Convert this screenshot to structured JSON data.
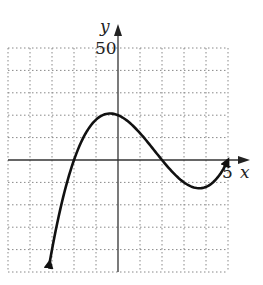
{
  "chart_data": {
    "type": "line",
    "title": "",
    "xlabel": "x",
    "ylabel": "y",
    "xlim": [
      -5,
      5
    ],
    "ylim": [
      -50,
      50
    ],
    "x_grid_step": 1,
    "y_grid_step": 10,
    "grid": true,
    "tick_labels": {
      "x": [
        "5"
      ],
      "y": [
        "50"
      ]
    },
    "function": "f(x) = (x+2)(x-2)(x-5)",
    "series": [
      {
        "name": "f(x)",
        "x": [
          -3.1,
          -3,
          -2.5,
          -2,
          -1.5,
          -1,
          -0.5,
          -0.2,
          0,
          0.5,
          1,
          1.5,
          2,
          2.5,
          3,
          3.5,
          4,
          4.5,
          5
        ],
        "values": [
          -45.1,
          -40,
          -18.6,
          0,
          11.4,
          18,
          20.6,
          20.9,
          20,
          16.9,
          12,
          6.1,
          0,
          -5.6,
          -10,
          -12.4,
          -12,
          -8.9,
          0
        ]
      }
    ],
    "roots": [
      -2,
      2,
      5
    ],
    "local_max": {
      "x": -0.2,
      "y": 20.9
    },
    "local_min": {
      "x": 3.5,
      "y": -12.4
    },
    "arrows": [
      "left-end-down",
      "right-end-up"
    ]
  },
  "labels": {
    "x_axis": "x",
    "y_axis": "y",
    "y_tick": "50",
    "x_tick": "5"
  }
}
